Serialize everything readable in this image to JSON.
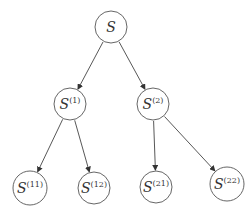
{
  "diagram": {
    "type": "tree",
    "colors": {
      "background": "#ffffff",
      "node_stroke": "#555555",
      "edge": "#444444",
      "text": "#333333"
    },
    "nodes": [
      {
        "id": "S",
        "base": "S",
        "sup": "",
        "cx": 111,
        "cy": 27,
        "r": 16
      },
      {
        "id": "S1",
        "base": "S",
        "sup": "(1)",
        "cx": 70,
        "cy": 104,
        "r": 16
      },
      {
        "id": "S2",
        "base": "S",
        "sup": "(2)",
        "cx": 153,
        "cy": 104,
        "r": 16
      },
      {
        "id": "S11",
        "base": "S",
        "sup": "(11)",
        "cx": 30,
        "cy": 188,
        "r": 17
      },
      {
        "id": "S12",
        "base": "S",
        "sup": "(12)",
        "cx": 94,
        "cy": 188,
        "r": 16
      },
      {
        "id": "S21",
        "base": "S",
        "sup": "(21)",
        "cx": 156,
        "cy": 187,
        "r": 16
      },
      {
        "id": "S22",
        "base": "S",
        "sup": "(22)",
        "cx": 227,
        "cy": 184,
        "r": 17
      }
    ],
    "edges": [
      {
        "from": "S",
        "to": "S1"
      },
      {
        "from": "S",
        "to": "S2"
      },
      {
        "from": "S1",
        "to": "S11"
      },
      {
        "from": "S1",
        "to": "S12"
      },
      {
        "from": "S2",
        "to": "S21"
      },
      {
        "from": "S2",
        "to": "S22"
      }
    ]
  }
}
